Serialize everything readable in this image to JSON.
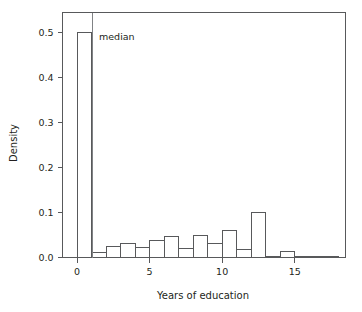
{
  "chart_data": {
    "type": "bar",
    "title": "",
    "subtitle": "",
    "xlabel": "Years of education",
    "ylabel": "Density",
    "xlim": [
      -1,
      18.5
    ],
    "ylim": [
      0,
      0.545
    ],
    "grid": false,
    "legend": null,
    "bin_width": 1,
    "categories": [
      "0-1",
      "1-2",
      "2-3",
      "3-4",
      "4-5",
      "5-6",
      "6-7",
      "7-8",
      "8-9",
      "9-10",
      "10-11",
      "11-12",
      "12-13",
      "13-14",
      "14-15",
      "15-16",
      "16-17",
      "17-18"
    ],
    "bin_starts": [
      0,
      1,
      2,
      3,
      4,
      5,
      6,
      7,
      8,
      9,
      10,
      11,
      12,
      13,
      14,
      15,
      16,
      17
    ],
    "values": [
      0.5,
      0.012,
      0.025,
      0.032,
      0.023,
      0.038,
      0.046,
      0.02,
      0.05,
      0.031,
      0.06,
      0.017,
      0.1,
      0.002,
      0.013,
      0.001,
      0.002,
      0.001
    ],
    "xticks": [
      0,
      5,
      10,
      15
    ],
    "xtick_labels": [
      "0",
      "5",
      "10",
      "15"
    ],
    "yticks": [
      0.0,
      0.1,
      0.2,
      0.3,
      0.4,
      0.5
    ],
    "ytick_labels": [
      "0.0",
      "0.1",
      "0.2",
      "0.3",
      "0.4",
      "0.5"
    ],
    "annotations": [
      {
        "name": "median-line",
        "label": "median",
        "x": 1.07,
        "orientation": "vertical"
      }
    ],
    "colors": {
      "bar_fill": "#ffffff",
      "bar_stroke": "#58595b",
      "axis": "#58595b",
      "text": "#231f20",
      "median_line": "#808285",
      "background": "#ffffff"
    }
  }
}
